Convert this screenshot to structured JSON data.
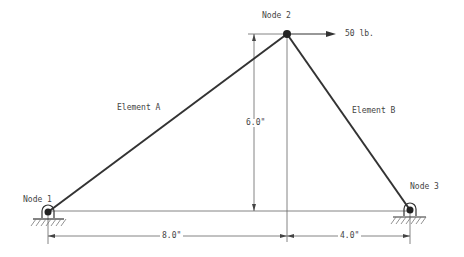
{
  "diagram": {
    "type": "truss",
    "nodes": [
      {
        "id": "node1",
        "label": "Node 1",
        "support": "pin"
      },
      {
        "id": "node2",
        "label": "Node 2"
      },
      {
        "id": "node3",
        "label": "Node 3",
        "support": "pin"
      }
    ],
    "elements": [
      {
        "id": "elemA",
        "label": "Element A",
        "from": "node1",
        "to": "node2"
      },
      {
        "id": "elemB",
        "label": "Element B",
        "from": "node2",
        "to": "node3"
      }
    ],
    "load": {
      "at": "node2",
      "label": "50 lb.",
      "direction": "right"
    },
    "dimensions": {
      "height": "6.0\"",
      "span_left": "8.0\"",
      "span_right": "4.0\""
    },
    "colors": {
      "member": "#333333",
      "line": "#555555",
      "text": "#444444"
    }
  }
}
